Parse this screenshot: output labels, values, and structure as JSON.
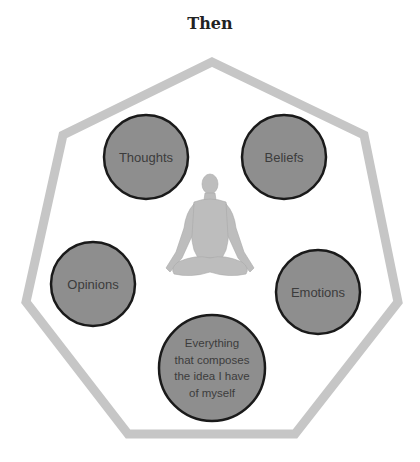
{
  "title": "Then",
  "colors": {
    "heptagon_stroke": "#c6c6c6",
    "circle_fill": "#8e8e8e",
    "circle_stroke": "#1a1a1a",
    "label_text": "#3c3c3c",
    "figure_fill": "#b9b9b9"
  },
  "heptagon": {
    "points": "212,62 364,135 398,302 295,434 128,434 26,302 63,135"
  },
  "center_figure": {
    "icon": "meditating-person-icon"
  },
  "nodes": [
    {
      "id": "thoughts",
      "lines": [
        "Thoughts"
      ],
      "cx": 146,
      "cy": 157,
      "r": 42
    },
    {
      "id": "beliefs",
      "lines": [
        "Beliefs"
      ],
      "cx": 284,
      "cy": 157,
      "r": 42
    },
    {
      "id": "opinions",
      "lines": [
        "Opinions"
      ],
      "cx": 93,
      "cy": 284,
      "r": 42
    },
    {
      "id": "emotions",
      "lines": [
        "Emotions"
      ],
      "cx": 318,
      "cy": 292,
      "r": 42
    },
    {
      "id": "self",
      "lines": [
        "Everything",
        "that composes",
        "the idea I have",
        "of myself"
      ],
      "cx": 212,
      "cy": 368,
      "r": 53
    }
  ]
}
